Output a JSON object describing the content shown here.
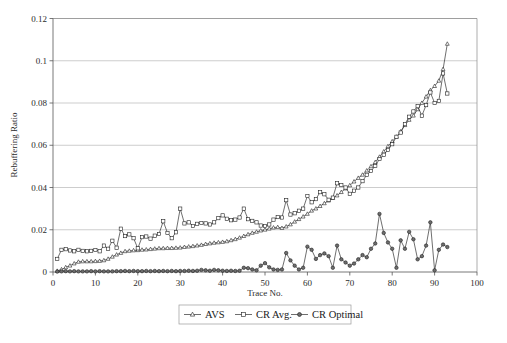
{
  "chart_data": {
    "type": "line",
    "title": "",
    "xlabel": "Trace No.",
    "ylabel": "Rebuffering Ratio",
    "xlim": [
      0,
      100
    ],
    "ylim": [
      0,
      0.12
    ],
    "xticks": [
      0,
      10,
      20,
      30,
      40,
      50,
      60,
      70,
      80,
      90,
      100
    ],
    "yticks": [
      0,
      0.02,
      0.04,
      0.06,
      0.08,
      0.1,
      0.12
    ],
    "xtick_labels": [
      "0",
      "10",
      "20",
      "30",
      "40",
      "50",
      "60",
      "70",
      "80",
      "90",
      "100"
    ],
    "ytick_labels": [
      "0",
      "0.02",
      "0.04",
      "0.06",
      "0.08",
      "0.1",
      "0.12"
    ],
    "grid": "horizontal",
    "legend_position": "bottom",
    "x": [
      1,
      2,
      3,
      4,
      5,
      6,
      7,
      8,
      9,
      10,
      11,
      12,
      13,
      14,
      15,
      16,
      17,
      18,
      19,
      20,
      21,
      22,
      23,
      24,
      25,
      26,
      27,
      28,
      29,
      30,
      31,
      32,
      33,
      34,
      35,
      36,
      37,
      38,
      39,
      40,
      41,
      42,
      43,
      44,
      45,
      46,
      47,
      48,
      49,
      50,
      51,
      52,
      53,
      54,
      55,
      56,
      57,
      58,
      59,
      60,
      61,
      62,
      63,
      64,
      65,
      66,
      67,
      68,
      69,
      70,
      71,
      72,
      73,
      74,
      75,
      76,
      77,
      78,
      79,
      80,
      81,
      82,
      83,
      84,
      85,
      86,
      87,
      88,
      89,
      90,
      91,
      92,
      93
    ],
    "series": [
      {
        "name": "AVS",
        "marker": "triangle",
        "values": [
          0.0005,
          0.0012,
          0.0022,
          0.003,
          0.004,
          0.0048,
          0.005,
          0.005,
          0.005,
          0.0051,
          0.0052,
          0.0055,
          0.0062,
          0.0072,
          0.0082,
          0.009,
          0.0098,
          0.01,
          0.0102,
          0.0103,
          0.0105,
          0.0106,
          0.0108,
          0.011,
          0.0112,
          0.0112,
          0.0113,
          0.0113,
          0.0114,
          0.0115,
          0.0118,
          0.012,
          0.0122,
          0.0125,
          0.0128,
          0.0132,
          0.0135,
          0.0138,
          0.014,
          0.0142,
          0.0145,
          0.015,
          0.0155,
          0.0162,
          0.017,
          0.0178,
          0.0185,
          0.019,
          0.0196,
          0.02,
          0.0205,
          0.021,
          0.0212,
          0.0208,
          0.0215,
          0.0225,
          0.0238,
          0.025,
          0.0262,
          0.0275,
          0.029,
          0.03,
          0.0312,
          0.0325,
          0.0338,
          0.035,
          0.0362,
          0.0378,
          0.0395,
          0.041,
          0.0428,
          0.0445,
          0.046,
          0.048,
          0.05,
          0.052,
          0.0545,
          0.057,
          0.0595,
          0.0618,
          0.064,
          0.0665,
          0.0695,
          0.072,
          0.074,
          0.077,
          0.08,
          0.083,
          0.086,
          0.088,
          0.0905,
          0.096,
          0.108
        ]
      },
      {
        "name": "CR Avg.",
        "marker": "square",
        "values": [
          0.0062,
          0.0105,
          0.0108,
          0.0102,
          0.0098,
          0.0105,
          0.01,
          0.0098,
          0.01,
          0.0104,
          0.0098,
          0.0125,
          0.011,
          0.0148,
          0.0115,
          0.0205,
          0.017,
          0.0178,
          0.016,
          0.0112,
          0.0165,
          0.0168,
          0.0158,
          0.0172,
          0.018,
          0.024,
          0.0185,
          0.016,
          0.0188,
          0.03,
          0.023,
          0.0235,
          0.0218,
          0.0228,
          0.0232,
          0.023,
          0.0225,
          0.0235,
          0.0255,
          0.0268,
          0.0252,
          0.0245,
          0.0248,
          0.0258,
          0.03,
          0.025,
          0.0242,
          0.0235,
          0.022,
          0.0218,
          0.0225,
          0.0248,
          0.026,
          0.0258,
          0.034,
          0.0272,
          0.0278,
          0.029,
          0.03,
          0.036,
          0.033,
          0.0345,
          0.0378,
          0.0368,
          0.0342,
          0.0352,
          0.042,
          0.0412,
          0.04,
          0.037,
          0.0385,
          0.04,
          0.043,
          0.046,
          0.0478,
          0.0502,
          0.0535,
          0.0555,
          0.0578,
          0.0605,
          0.064,
          0.066,
          0.07,
          0.0735,
          0.076,
          0.0785,
          0.074,
          0.079,
          0.085,
          0.08,
          0.081,
          0.094,
          0.0845
        ]
      },
      {
        "name": "CR Optimal",
        "marker": "circle",
        "values": [
          0.0002,
          0.0003,
          0.0004,
          0.0003,
          0.0004,
          0.0003,
          0.0003,
          0.0003,
          0.0004,
          0.0003,
          0.0004,
          0.0003,
          0.0003,
          0.0003,
          0.0004,
          0.0004,
          0.0005,
          0.0004,
          0.0005,
          0.0004,
          0.0004,
          0.0005,
          0.0004,
          0.0005,
          0.0004,
          0.0005,
          0.0004,
          0.0005,
          0.0004,
          0.0005,
          0.0005,
          0.0006,
          0.0005,
          0.0006,
          0.001,
          0.0008,
          0.0006,
          0.001,
          0.0008,
          0.0006,
          0.0005,
          0.0006,
          0.0005,
          0.0006,
          0.002,
          0.0018,
          0.0012,
          0.0008,
          0.003,
          0.0042,
          0.0022,
          0.0012,
          0.001,
          0.0012,
          0.009,
          0.0055,
          0.003,
          0.0012,
          0.002,
          0.012,
          0.0105,
          0.0062,
          0.008,
          0.0088,
          0.0075,
          0.002,
          0.0125,
          0.006,
          0.0045,
          0.003,
          0.004,
          0.006,
          0.008,
          0.007,
          0.011,
          0.0135,
          0.0275,
          0.0185,
          0.014,
          0.011,
          0.002,
          0.015,
          0.011,
          0.019,
          0.0155,
          0.006,
          0.0075,
          0.0125,
          0.0235,
          0.0008,
          0.0105,
          0.013,
          0.0118
        ]
      }
    ],
    "legend": [
      {
        "label": "AVS",
        "marker": "triangle"
      },
      {
        "label": "CR Avg.",
        "marker": "square"
      },
      {
        "label": "CR Optimal",
        "marker": "circle"
      }
    ]
  }
}
